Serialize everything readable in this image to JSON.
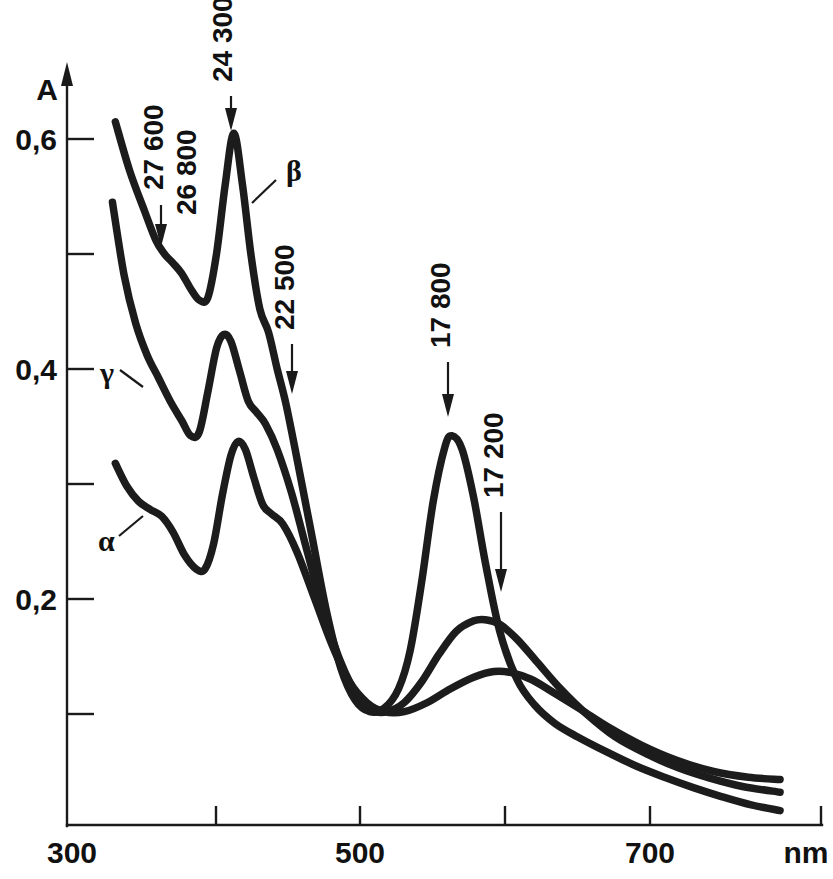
{
  "figure": {
    "background_color": "#ffffff",
    "ink_color": "#1c1c1c"
  },
  "axes": {
    "y_axis_title": "A",
    "x_axis_unit_label": "nm",
    "y_tick_labels": [
      "0,6",
      "0,4",
      "0,2"
    ],
    "x_tick_labels": [
      "300",
      "500",
      "700"
    ]
  },
  "curve_labels": {
    "alpha": "α",
    "beta": "β",
    "gamma": "γ"
  },
  "annotations": {
    "a1": "27 600",
    "a2": "26 800",
    "a3": "24 300",
    "a4": "22 500",
    "a5": "17 800",
    "a6": "17 200"
  },
  "chart_data": {
    "type": "line",
    "title": "",
    "xlabel": "nm",
    "ylabel": "A",
    "xlim": [
      300,
      800
    ],
    "ylim": [
      0.0,
      0.65
    ],
    "x_ticks_major": [
      300,
      500,
      700
    ],
    "x_ticks_minor": [
      400,
      600
    ],
    "y_ticks_major": [
      0.2,
      0.4,
      0.6
    ],
    "y_ticks_minor": [
      0.1,
      0.3,
      0.5
    ],
    "grid": false,
    "legend": "inline-curve-labels",
    "annotations": [
      {
        "label": "27 600",
        "wavenumber_cm1": 27600,
        "x_nm": 362,
        "y": 0.505,
        "curve": "beta"
      },
      {
        "label": "26 800",
        "wavenumber_cm1": 26800,
        "x_nm": 373,
        "y": 0.49,
        "curve": "beta"
      },
      {
        "label": "24 300",
        "wavenumber_cm1": 24300,
        "x_nm": 412,
        "y": 0.605,
        "curve": "beta"
      },
      {
        "label": "22 500",
        "wavenumber_cm1": 22500,
        "x_nm": 444,
        "y": 0.375,
        "curve": "beta"
      },
      {
        "label": "17 800",
        "wavenumber_cm1": 17800,
        "x_nm": 562,
        "y": 0.34,
        "curve": "beta"
      },
      {
        "label": "17 200",
        "wavenumber_cm1": 17200,
        "x_nm": 582,
        "y": 0.182,
        "curve": "gamma"
      }
    ],
    "series": [
      {
        "name": "β",
        "label": "β",
        "points": [
          [
            330,
            0.615
          ],
          [
            340,
            0.572
          ],
          [
            350,
            0.538
          ],
          [
            358,
            0.512
          ],
          [
            364,
            0.5
          ],
          [
            370,
            0.492
          ],
          [
            376,
            0.483
          ],
          [
            382,
            0.47
          ],
          [
            388,
            0.46
          ],
          [
            394,
            0.462
          ],
          [
            400,
            0.5
          ],
          [
            406,
            0.56
          ],
          [
            412,
            0.605
          ],
          [
            418,
            0.56
          ],
          [
            424,
            0.498
          ],
          [
            430,
            0.452
          ],
          [
            436,
            0.432
          ],
          [
            442,
            0.4
          ],
          [
            448,
            0.37
          ],
          [
            456,
            0.32
          ],
          [
            466,
            0.255
          ],
          [
            476,
            0.19
          ],
          [
            486,
            0.14
          ],
          [
            496,
            0.112
          ],
          [
            506,
            0.102
          ],
          [
            516,
            0.105
          ],
          [
            526,
            0.122
          ],
          [
            534,
            0.155
          ],
          [
            542,
            0.215
          ],
          [
            550,
            0.285
          ],
          [
            558,
            0.332
          ],
          [
            563,
            0.342
          ],
          [
            570,
            0.33
          ],
          [
            578,
            0.288
          ],
          [
            586,
            0.232
          ],
          [
            596,
            0.172
          ],
          [
            608,
            0.13
          ],
          [
            620,
            0.108
          ],
          [
            634,
            0.092
          ],
          [
            650,
            0.08
          ],
          [
            670,
            0.067
          ],
          [
            690,
            0.055
          ],
          [
            710,
            0.045
          ],
          [
            730,
            0.036
          ],
          [
            750,
            0.028
          ],
          [
            770,
            0.021
          ],
          [
            790,
            0.016
          ]
        ]
      },
      {
        "name": "γ",
        "label": "γ",
        "points": [
          [
            328,
            0.545
          ],
          [
            336,
            0.482
          ],
          [
            344,
            0.44
          ],
          [
            352,
            0.412
          ],
          [
            360,
            0.392
          ],
          [
            368,
            0.372
          ],
          [
            376,
            0.355
          ],
          [
            382,
            0.342
          ],
          [
            388,
            0.345
          ],
          [
            394,
            0.38
          ],
          [
            400,
            0.418
          ],
          [
            405,
            0.43
          ],
          [
            410,
            0.424
          ],
          [
            416,
            0.398
          ],
          [
            422,
            0.372
          ],
          [
            428,
            0.362
          ],
          [
            434,
            0.352
          ],
          [
            442,
            0.33
          ],
          [
            452,
            0.292
          ],
          [
            462,
            0.245
          ],
          [
            474,
            0.19
          ],
          [
            486,
            0.145
          ],
          [
            498,
            0.115
          ],
          [
            508,
            0.103
          ],
          [
            518,
            0.102
          ],
          [
            530,
            0.11
          ],
          [
            542,
            0.128
          ],
          [
            554,
            0.152
          ],
          [
            566,
            0.172
          ],
          [
            578,
            0.181
          ],
          [
            586,
            0.182
          ],
          [
            596,
            0.178
          ],
          [
            608,
            0.165
          ],
          [
            622,
            0.145
          ],
          [
            638,
            0.122
          ],
          [
            656,
            0.1
          ],
          [
            676,
            0.08
          ],
          [
            698,
            0.065
          ],
          [
            720,
            0.053
          ],
          [
            742,
            0.044
          ],
          [
            764,
            0.037
          ],
          [
            790,
            0.032
          ]
        ]
      },
      {
        "name": "α",
        "label": "α",
        "points": [
          [
            330,
            0.318
          ],
          [
            338,
            0.298
          ],
          [
            346,
            0.285
          ],
          [
            354,
            0.278
          ],
          [
            362,
            0.272
          ],
          [
            370,
            0.258
          ],
          [
            378,
            0.238
          ],
          [
            386,
            0.226
          ],
          [
            392,
            0.226
          ],
          [
            398,
            0.248
          ],
          [
            404,
            0.29
          ],
          [
            410,
            0.325
          ],
          [
            415,
            0.337
          ],
          [
            420,
            0.33
          ],
          [
            426,
            0.305
          ],
          [
            432,
            0.282
          ],
          [
            438,
            0.274
          ],
          [
            446,
            0.265
          ],
          [
            456,
            0.24
          ],
          [
            468,
            0.2
          ],
          [
            480,
            0.16
          ],
          [
            492,
            0.128
          ],
          [
            504,
            0.11
          ],
          [
            516,
            0.102
          ],
          [
            530,
            0.102
          ],
          [
            546,
            0.11
          ],
          [
            562,
            0.122
          ],
          [
            578,
            0.132
          ],
          [
            592,
            0.137
          ],
          [
            604,
            0.136
          ],
          [
            618,
            0.13
          ],
          [
            634,
            0.118
          ],
          [
            652,
            0.104
          ],
          [
            672,
            0.088
          ],
          [
            694,
            0.073
          ],
          [
            718,
            0.06
          ],
          [
            744,
            0.05
          ],
          [
            768,
            0.045
          ],
          [
            790,
            0.043
          ]
        ]
      }
    ]
  }
}
